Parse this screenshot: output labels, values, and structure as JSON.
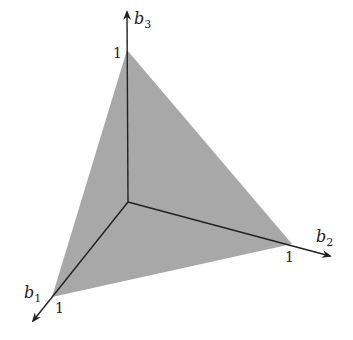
{
  "diagram": {
    "title": "",
    "fill_color": "#a8a8a8",
    "axis_color": "#222222",
    "origin": [
      128,
      202
    ],
    "axes": [
      {
        "name": "b1",
        "label_base": "b",
        "label_sub": "1",
        "tick_label": "1"
      },
      {
        "name": "b2",
        "label_base": "b",
        "label_sub": "2",
        "tick_label": "1"
      },
      {
        "name": "b3",
        "label_base": "b",
        "label_sub": "3",
        "tick_label": "1"
      }
    ],
    "simplex_vertices": [
      [
        127,
        50
      ],
      [
        292,
        244
      ],
      [
        52,
        297
      ]
    ]
  }
}
